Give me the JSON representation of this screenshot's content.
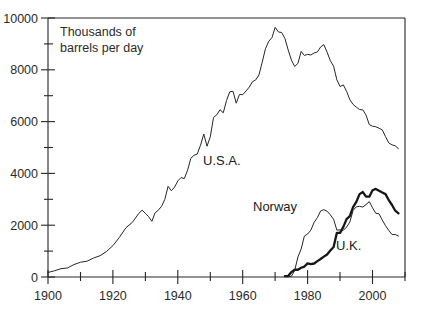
{
  "chart_data": {
    "type": "line",
    "title": "",
    "subtitle": "",
    "xlabel": "",
    "ylabel": "Thousands of barrels per day",
    "axis_note": "Thousands of\nbarrels per day",
    "axis_note_line1": "Thousands of",
    "axis_note_line2": "barrels per day",
    "xlim": [
      1900,
      2010
    ],
    "ylim": [
      0,
      10000
    ],
    "grid": false,
    "legend": "inline-annotations",
    "x_major_ticks": [
      1900,
      1920,
      1940,
      1960,
      1980,
      2000
    ],
    "x_major_ticklabels": [
      "1900",
      "1920",
      "1940",
      "1960",
      "1980",
      "2000"
    ],
    "x_minor_ticks": [
      1910,
      1930,
      1950,
      1970,
      1990,
      2010
    ],
    "y_major_ticks": [
      0,
      2000,
      4000,
      6000,
      8000,
      10000
    ],
    "y_major_ticklabels": [
      "0",
      "2000",
      "4000",
      "6000",
      "8000",
      "10000"
    ],
    "y_minor_ticks": [
      1000,
      3000,
      5000,
      7000,
      9000
    ],
    "annotations": [
      {
        "text": "U.S.A.",
        "x": 1952,
        "y": 3750
      },
      {
        "text": "Norway",
        "x": 1975,
        "y": 2500
      },
      {
        "text": "U.K.",
        "x": 1992,
        "y": 1150
      }
    ],
    "series": [
      {
        "name": "U.S.A.",
        "style": "thin",
        "x": [
          1900,
          1902,
          1904,
          1906,
          1908,
          1910,
          1912,
          1914,
          1916,
          1918,
          1920,
          1922,
          1924,
          1926,
          1928,
          1929,
          1930,
          1931,
          1932,
          1933,
          1934,
          1935,
          1936,
          1937,
          1938,
          1939,
          1940,
          1941,
          1942,
          1943,
          1944,
          1945,
          1946,
          1947,
          1948,
          1949,
          1950,
          1951,
          1952,
          1953,
          1954,
          1955,
          1956,
          1957,
          1958,
          1959,
          1960,
          1961,
          1962,
          1963,
          1964,
          1965,
          1966,
          1967,
          1968,
          1969,
          1970,
          1971,
          1972,
          1973,
          1974,
          1975,
          1976,
          1977,
          1978,
          1979,
          1980,
          1981,
          1982,
          1983,
          1984,
          1985,
          1986,
          1987,
          1988,
          1989,
          1990,
          1991,
          1992,
          1993,
          1994,
          1995,
          1996,
          1997,
          1998,
          1999,
          2000,
          2001,
          2002,
          2003,
          2004,
          2005,
          2006,
          2007,
          2008
        ],
        "values": [
          174,
          240,
          320,
          350,
          480,
          570,
          610,
          730,
          820,
          980,
          1210,
          1530,
          1900,
          2110,
          2460,
          2580,
          2460,
          2330,
          2150,
          2480,
          2580,
          2730,
          3000,
          3500,
          3330,
          3470,
          3710,
          3840,
          3800,
          4120,
          4580,
          4700,
          4750,
          5090,
          5520,
          5050,
          5410,
          6160,
          6260,
          6460,
          6340,
          6810,
          7150,
          7170,
          6710,
          7050,
          7040,
          7180,
          7330,
          7540,
          7610,
          7800,
          8290,
          8810,
          9100,
          9240,
          9640,
          9460,
          9440,
          9210,
          8770,
          8375,
          8130,
          8245,
          8710,
          8552,
          8597,
          8572,
          8649,
          8688,
          8879,
          8971,
          8680,
          8349,
          8140,
          7613,
          7355,
          7417,
          7171,
          6847,
          6662,
          6560,
          6465,
          6452,
          6252,
          5881,
          5822,
          5801,
          5746,
          5681,
          5419,
          5178,
          5102,
          5064,
          4950
        ]
      },
      {
        "name": "Norway",
        "style": "thick",
        "x": [
          1973,
          1974,
          1975,
          1976,
          1977,
          1978,
          1979,
          1980,
          1981,
          1982,
          1983,
          1984,
          1985,
          1986,
          1987,
          1988,
          1989,
          1990,
          1991,
          1992,
          1993,
          1994,
          1995,
          1996,
          1997,
          1998,
          1999,
          2000,
          2001,
          2002,
          2003,
          2004,
          2005,
          2006,
          2007,
          2008
        ],
        "values": [
          32,
          35,
          189,
          280,
          280,
          356,
          403,
          528,
          501,
          521,
          614,
          697,
          788,
          870,
          1022,
          1157,
          1704,
          1704,
          1934,
          2234,
          2350,
          2700,
          2900,
          3200,
          3280,
          3100,
          3100,
          3350,
          3400,
          3330,
          3260,
          3200,
          2970,
          2780,
          2560,
          2460
        ]
      },
      {
        "name": "U.K.",
        "style": "thin",
        "x": [
          1974,
          1975,
          1976,
          1977,
          1978,
          1979,
          1980,
          1981,
          1982,
          1983,
          1984,
          1985,
          1986,
          1987,
          1988,
          1989,
          1990,
          1991,
          1992,
          1993,
          1994,
          1995,
          1996,
          1997,
          1998,
          1999,
          2000,
          2001,
          2002,
          2003,
          2004,
          2005,
          2006,
          2007,
          2008
        ],
        "values": [
          10,
          30,
          245,
          770,
          1080,
          1580,
          1660,
          1810,
          2110,
          2290,
          2550,
          2600,
          2540,
          2400,
          2230,
          1810,
          1820,
          1800,
          1930,
          2120,
          2570,
          2710,
          2730,
          2700,
          2800,
          2910,
          2670,
          2460,
          2440,
          2200,
          1980,
          1800,
          1640,
          1640,
          1580
        ]
      }
    ]
  }
}
